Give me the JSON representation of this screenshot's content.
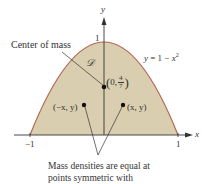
{
  "figure": {
    "axes": {
      "x_label": "x",
      "y_label": "y",
      "x_tick_neg": "−1",
      "x_tick_pos": "1",
      "y_tick": "1"
    },
    "curve_equation": "y = 1 − x²",
    "curve_eq_parts": {
      "lhs": "y",
      "eq": " = 1 − ",
      "var": "x",
      "exp": "2"
    },
    "region_label": "𝒟",
    "centroid": {
      "label": "Center of mass",
      "coord_prefix": "0,",
      "frac_num": "4",
      "frac_den": "7"
    },
    "points": [
      {
        "label": "(−x, y)"
      },
      {
        "label": "(x, y)"
      }
    ],
    "caption_lines": [
      "Mass densities are equal at",
      "points symmetric with"
    ],
    "colors": {
      "region_fill": "#d9ceb0",
      "curve": "#b5654f",
      "axis": "#333333",
      "text": "#333333"
    }
  }
}
